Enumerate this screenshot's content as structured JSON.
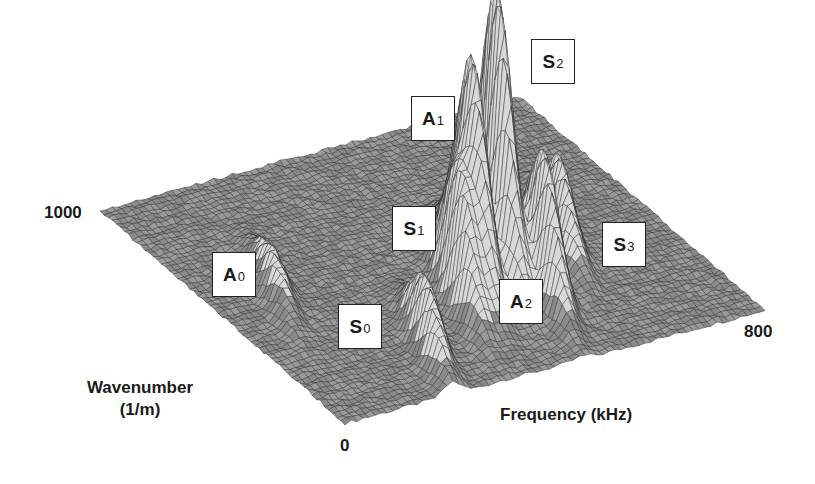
{
  "chart_data": {
    "type": "surface3d",
    "title": "",
    "xlabel": "Frequency (kHz)",
    "ylabel": "Wavenumber (1/m)",
    "zlabel": "",
    "x_range": [
      0,
      800
    ],
    "y_range": [
      0,
      1000
    ],
    "x_ticks": [
      "0",
      "800"
    ],
    "y_ticks": [
      "0",
      "1000"
    ],
    "grid": false,
    "style": "wireframe mesh, grayscale",
    "modes": [
      {
        "name": "A0",
        "base": "A",
        "sub": "0",
        "approx_freq_khz": 120,
        "approx_wavenumber": 550,
        "relative_amplitude": 0.15
      },
      {
        "name": "S0",
        "base": "S",
        "sub": "0",
        "approx_freq_khz": 250,
        "approx_wavenumber": 200,
        "relative_amplitude": 0.25
      },
      {
        "name": "S1",
        "base": "S",
        "sub": "1",
        "approx_freq_khz": 380,
        "approx_wavenumber": 350,
        "relative_amplitude": 0.45
      },
      {
        "name": "A1",
        "base": "A",
        "sub": "1",
        "approx_freq_khz": 430,
        "approx_wavenumber": 400,
        "relative_amplitude": 0.8
      },
      {
        "name": "S2",
        "base": "S",
        "sub": "2",
        "approx_freq_khz": 500,
        "approx_wavenumber": 450,
        "relative_amplitude": 1.0
      },
      {
        "name": "A2",
        "base": "A",
        "sub": "2",
        "approx_freq_khz": 520,
        "approx_wavenumber": 300,
        "relative_amplitude": 0.5
      },
      {
        "name": "S3",
        "base": "S",
        "sub": "3",
        "approx_freq_khz": 620,
        "approx_wavenumber": 450,
        "relative_amplitude": 0.3
      }
    ]
  },
  "axes": {
    "y_max_label": "1000",
    "x_max_label": "800",
    "origin_label": "0",
    "ylabel_line1": "Wavenumber",
    "ylabel_line2": "(1/m)",
    "xlabel": "Frequency (kHz)"
  },
  "labels": {
    "A0": {
      "base": "A",
      "sub": "0"
    },
    "S0": {
      "base": "S",
      "sub": "0"
    },
    "S1": {
      "base": "S",
      "sub": "1"
    },
    "A1": {
      "base": "A",
      "sub": "1"
    },
    "S2": {
      "base": "S",
      "sub": "2"
    },
    "A2": {
      "base": "A",
      "sub": "2"
    },
    "S3": {
      "base": "S",
      "sub": "3"
    }
  },
  "colors": {
    "mesh_line": "#2e2e2e",
    "mesh_fill": "#8a8a8a",
    "peak_fill": "#d8d8d8",
    "background": "#ffffff"
  }
}
